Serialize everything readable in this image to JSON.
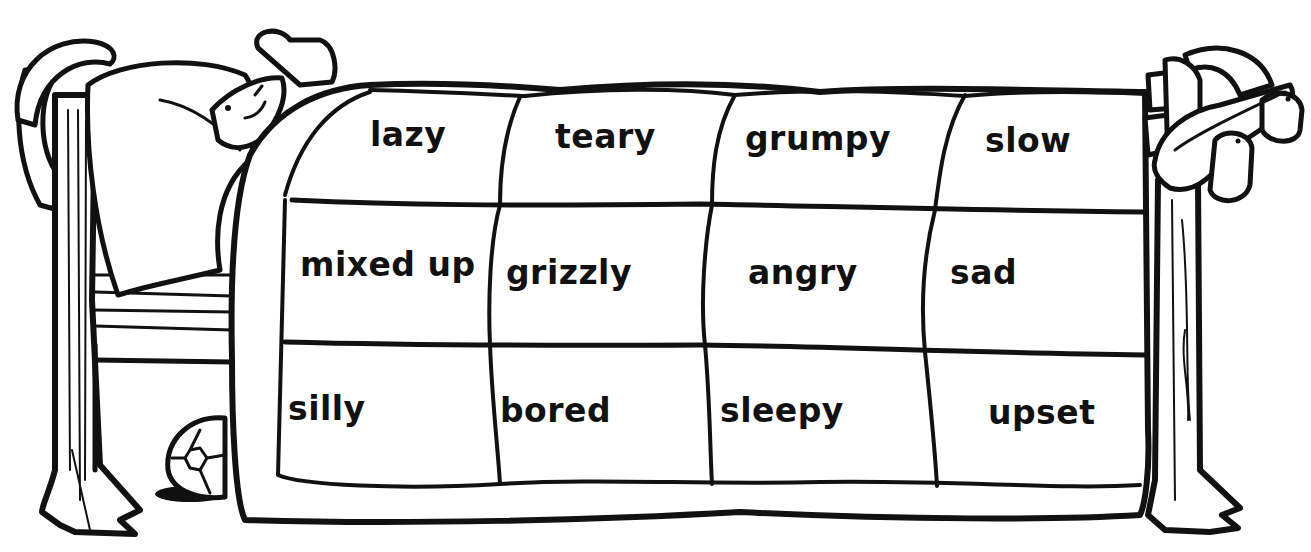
{
  "worksheet": {
    "subject": "bear in bed under a quilt",
    "ink_color": "#111111",
    "paper_color": "#ffffff",
    "quilt": {
      "rows": [
        [
          "lazy",
          "teary",
          "grumpy",
          "slow"
        ],
        [
          "mixed up",
          "grizzly",
          "angry",
          "sad"
        ],
        [
          "silly",
          "bored",
          "sleepy",
          "upset"
        ]
      ]
    }
  }
}
